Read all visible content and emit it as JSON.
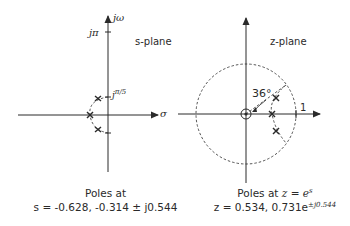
{
  "s_plane": {
    "title": "s-plane",
    "axis_imag_label": "jω",
    "axis_real_label": "σ",
    "tick_top": "jπ",
    "tick_pole": "jπ/5",
    "poles": [
      {
        "re": -0.628,
        "im": 0
      },
      {
        "re": -0.314,
        "im": 0.544
      },
      {
        "re": -0.314,
        "im": -0.544
      }
    ],
    "caption_line1": "Poles at",
    "caption_line2": "s = -0.628, -0.314 ± j0.544"
  },
  "z_plane": {
    "title": "z-plane",
    "angle_label": "36°",
    "unit_label": "1",
    "poles": [
      {
        "re": 0.534,
        "im": 0
      },
      {
        "mag": 0.731,
        "angle_rad": 0.544
      },
      {
        "mag": 0.731,
        "angle_rad": -0.544
      }
    ],
    "caption_line1_prefix": "Poles at ",
    "caption_line1_eq": "z = e",
    "caption_line1_sup": "s",
    "caption_line2_main": "z = 0.534, 0.731e",
    "caption_line2_sup": "±j0.544"
  },
  "colors": {
    "ink": "#2a2a2a",
    "background": "#ffffff"
  }
}
